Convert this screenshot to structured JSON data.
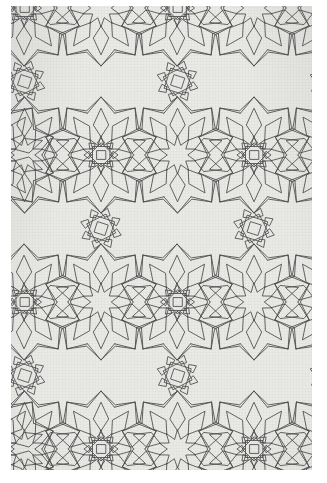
{
  "artwork": {
    "title": "Islamic geometric interlace pattern",
    "medium_appearance": "photocopied line drawing on toned paper",
    "symmetry": "10-fold rosettes on a centered-rectangular lattice"
  },
  "page": {
    "width": 327,
    "height": 483,
    "background_color": "#ffffff"
  },
  "plate": {
    "left": 11,
    "top": 6,
    "width": 301,
    "height": 464,
    "paper_color": "#e9e9e6",
    "ink_color": "#3a3a3c",
    "line_width": 0.85
  },
  "lattice": {
    "spacing_x": 153,
    "spacing_y": 147,
    "row_offset_x": 76.5,
    "origin_x": 90,
    "origin_y": 2,
    "rosette_points": 10,
    "rosette_outer_radius": 58,
    "rosette_petal_radius": 36,
    "rosette_core_radius": 19,
    "columns": 4,
    "rows": 5
  },
  "motifs": {
    "rosette": "ten-pointed-star-rosette",
    "filler_square": "rotated-square-interlace",
    "filler_kite": "kite-and-dart-interlace"
  },
  "chart_data": {
    "type": "scatter",
    "xlabel": "x",
    "ylabel": "y",
    "xlim": [
      0,
      327
    ],
    "ylim": [
      0,
      483
    ],
    "series": [
      {
        "name": "rosette-centres-row-A",
        "x": [
          13,
          166,
          319
        ],
        "y": [
          2,
          2,
          2
        ]
      },
      {
        "name": "rosette-centres-row-B",
        "x": [
          -13,
          90,
          243,
          396
        ],
        "y": [
          149,
          149,
          149,
          149
        ]
      },
      {
        "name": "rosette-centres-row-C",
        "x": [
          13,
          166,
          319
        ],
        "y": [
          296,
          296,
          296
        ]
      },
      {
        "name": "rosette-centres-row-D",
        "x": [
          -13,
          90,
          243,
          396
        ],
        "y": [
          443,
          443,
          443,
          443
        ]
      }
    ]
  }
}
